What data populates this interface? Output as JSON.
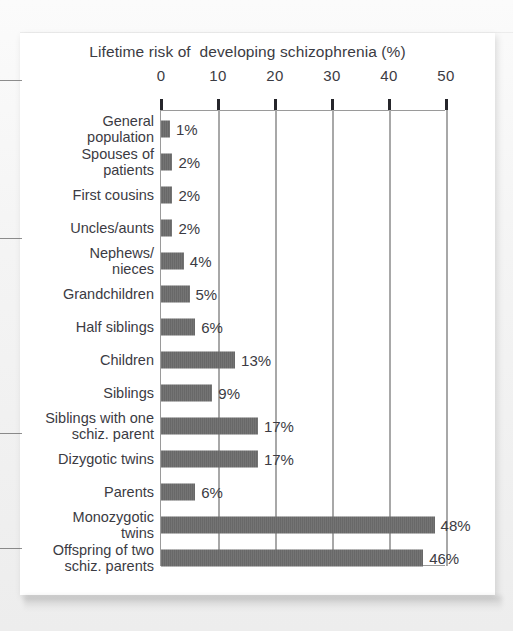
{
  "chart_data": {
    "type": "bar",
    "orientation": "horizontal",
    "title": "Lifetime risk of  developing schizophrenia (%)",
    "xlabel": "",
    "ylabel": "",
    "xlim": [
      0,
      50
    ],
    "xticks": [
      0,
      10,
      20,
      30,
      40,
      50
    ],
    "xtick_labels": [
      "0",
      "10",
      "20",
      "30",
      "40",
      "50"
    ],
    "grid": "vertical",
    "legend": "none",
    "bar_color": "#6d6d6d",
    "axis_color": "#9a9a9a",
    "text_color": "#3b3b43",
    "categories": [
      "General\npopulation",
      "Spouses of\npatients",
      "First cousins",
      "Uncles/aunts",
      "Nephews/\nnieces",
      "Grandchildren",
      "Half siblings",
      "Children",
      "Siblings",
      "Siblings with one\nschiz. parent",
      "Dizygotic twins",
      "Parents",
      "Monozygotic\ntwins",
      "Offspring of two\nschiz. parents"
    ],
    "values": [
      1,
      2,
      2,
      2,
      4,
      5,
      6,
      13,
      9,
      17,
      17,
      6,
      48,
      46
    ],
    "data_labels": [
      "1%",
      "2%",
      "2%",
      "2%",
      "4%",
      "5%",
      "6%",
      "13%",
      "9%",
      "17%",
      "17%",
      "6%",
      "48%",
      "46%"
    ]
  },
  "page": {
    "margin_marks": 4
  }
}
